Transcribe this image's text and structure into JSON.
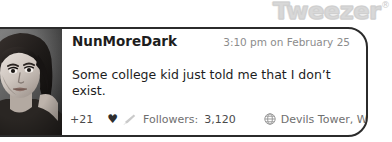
{
  "brand": {
    "name": "Tweezer",
    "trademark": "®",
    "color": "#d8d8d8"
  },
  "post": {
    "avatar_alt": "user-avatar-photo",
    "username": "NunMoreDark",
    "timestamp": "3:10 pm on February 25",
    "message": "Some college kid just told me that I don’t exist.",
    "footer": {
      "plus_count": "+21",
      "heart_icon": "heart-icon",
      "sparkle_icon": "sparkle-icon",
      "followers_label": "Followers:",
      "followers_count": "3,120",
      "globe_icon": "globe-icon",
      "location": "Devils Tower, WY"
    }
  },
  "colors": {
    "card_border": "#2b2b2b",
    "text_primary": "#1d1d1d",
    "text_muted": "#6f6f6f",
    "timestamp": "#8c8c8c"
  }
}
